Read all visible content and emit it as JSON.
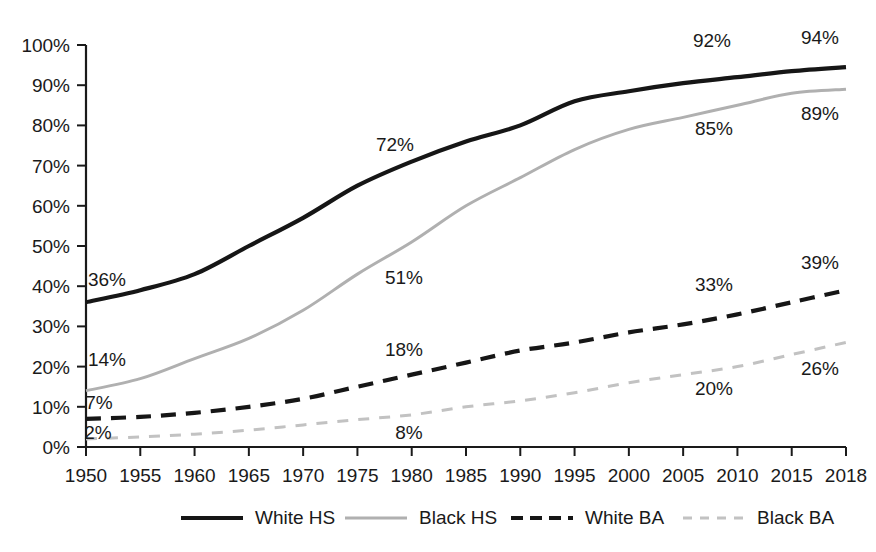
{
  "chart_data": {
    "type": "line",
    "title": "",
    "subtitle": "",
    "xlabel": "",
    "ylabel": "",
    "xlim": [
      1950,
      2018
    ],
    "ylim": [
      0,
      100
    ],
    "grid": false,
    "legend_position": "bottom",
    "x": [
      1950,
      1955,
      1960,
      1965,
      1970,
      1975,
      1980,
      1985,
      1990,
      1995,
      2000,
      2005,
      2010,
      2015,
      2018
    ],
    "xticklabels": [
      "1950",
      "1955",
      "1960",
      "1965",
      "1970",
      "1975",
      "1980",
      "1985",
      "1990",
      "1995",
      "2000",
      "2005",
      "2010",
      "2015",
      "2018"
    ],
    "yticks": [
      0,
      10,
      20,
      30,
      40,
      50,
      60,
      70,
      80,
      90,
      100
    ],
    "yticklabels": [
      "0%",
      "10%",
      "20%",
      "30%",
      "40%",
      "50%",
      "60%",
      "70%",
      "80%",
      "90%",
      "100%"
    ],
    "series": [
      {
        "name": "White HS",
        "color": "#161616",
        "style": "solid",
        "width": 4.2,
        "values": [
          36,
          39,
          43,
          50,
          57,
          65,
          71,
          76,
          80,
          86,
          88.5,
          90.5,
          92,
          93.5,
          94.5
        ]
      },
      {
        "name": "Black HS",
        "color": "#b0b0b0",
        "style": "solid",
        "width": 3.0,
        "values": [
          14,
          17,
          22,
          27,
          34,
          43,
          51,
          60,
          67,
          74,
          79,
          82,
          85,
          88,
          89
        ]
      },
      {
        "name": "White BA",
        "color": "#161616",
        "style": "dashed",
        "width": 4.2,
        "values": [
          7,
          7.5,
          8.5,
          10,
          12,
          15,
          18,
          21,
          24,
          26,
          28.5,
          30.5,
          33,
          36,
          39
        ]
      },
      {
        "name": "Black BA",
        "color": "#c2c2c2",
        "style": "dashed",
        "width": 3.0,
        "values": [
          2,
          2.5,
          3.2,
          4.2,
          5.5,
          6.8,
          8,
          10,
          11.5,
          13.5,
          16,
          18,
          20,
          23,
          26
        ]
      }
    ],
    "data_labels": [
      {
        "text": "36%",
        "series": "White HS",
        "year": 1950,
        "x": 107,
        "y": 286
      },
      {
        "text": "72%",
        "series": "White HS",
        "year": 1975,
        "x": 395,
        "y": 151
      },
      {
        "text": "92%",
        "series": "White HS",
        "year": 2010,
        "x": 712,
        "y": 47
      },
      {
        "text": "94%",
        "series": "White HS",
        "year": 2018,
        "x": 820,
        "y": 44
      },
      {
        "text": "14%",
        "series": "Black HS",
        "year": 1950,
        "x": 107,
        "y": 366
      },
      {
        "text": "51%",
        "series": "Black HS",
        "year": 1980,
        "x": 404,
        "y": 284
      },
      {
        "text": "85%",
        "series": "Black HS",
        "year": 2010,
        "x": 714,
        "y": 135
      },
      {
        "text": "89%",
        "series": "Black HS",
        "year": 2018,
        "x": 820,
        "y": 120
      },
      {
        "text": "7%",
        "series": "White BA",
        "year": 1950,
        "x": 99,
        "y": 409
      },
      {
        "text": "18%",
        "series": "White BA",
        "year": 1980,
        "x": 404,
        "y": 356
      },
      {
        "text": "33%",
        "series": "White BA",
        "year": 2010,
        "x": 714,
        "y": 291
      },
      {
        "text": "39%",
        "series": "White BA",
        "year": 2018,
        "x": 820,
        "y": 269
      },
      {
        "text": "2%",
        "series": "Black BA",
        "year": 1950,
        "x": 98,
        "y": 439
      },
      {
        "text": "8%",
        "series": "Black BA",
        "year": 1980,
        "x": 409,
        "y": 439
      },
      {
        "text": "20%",
        "series": "Black BA",
        "year": 2010,
        "x": 714,
        "y": 395
      },
      {
        "text": "26%",
        "series": "Black BA",
        "year": 2018,
        "x": 820,
        "y": 375
      }
    ],
    "legend": [
      {
        "label": "White HS",
        "color": "#161616",
        "style": "solid",
        "width": 4.2
      },
      {
        "label": "Black HS",
        "color": "#b0b0b0",
        "style": "solid",
        "width": 3.0
      },
      {
        "label": "White BA",
        "color": "#161616",
        "style": "dashed",
        "width": 4.2
      },
      {
        "label": "Black BA",
        "color": "#c2c2c2",
        "style": "dashed",
        "width": 3.0
      }
    ]
  }
}
